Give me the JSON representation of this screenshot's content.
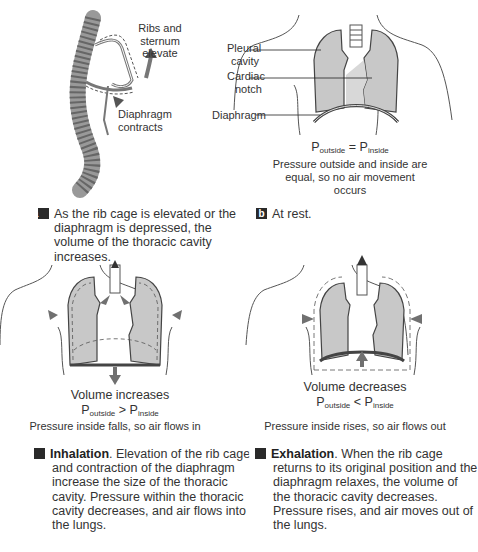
{
  "panels": {
    "a": {
      "badge": "a",
      "labels": {
        "ribs": [
          "Ribs and",
          "sternum",
          "elevate"
        ],
        "diaphragm": [
          "Diaphragm",
          "contracts"
        ]
      },
      "caption": "As the rib cage is elevated or the diaphragm is depressed, the volume of the thoracic cavity increases."
    },
    "b": {
      "badge": "b",
      "labels": {
        "pleural": [
          "Pleural",
          "cavity"
        ],
        "cardiac": [
          "Cardiac",
          "notch"
        ],
        "diaphragm": "Diaphragm"
      },
      "pressure": {
        "left": "P",
        "left_sub": "outside",
        "op": " = ",
        "right": "P",
        "right_sub": "inside"
      },
      "note": [
        "Pressure outside and inside are",
        "equal, so no air movement occurs"
      ],
      "caption": "At rest."
    },
    "c": {
      "badge": "c",
      "volume": "Volume increases",
      "pressure": {
        "left": "P",
        "left_sub": "outside",
        "op": " > ",
        "right": "P",
        "right_sub": "inside"
      },
      "note": "Pressure inside falls, so air flows in",
      "caption_title": "Inhalation",
      "caption": ". Elevation of the rib cage and contraction of the diaphragm increase the size of the thoracic cavity. Pressure within the thoracic cavity decreases, and air flows into the lungs."
    },
    "d": {
      "badge": "d",
      "volume": "Volume decreases",
      "pressure": {
        "left": "P",
        "left_sub": "outside",
        "op": " < ",
        "right": "P",
        "right_sub": "inside"
      },
      "note": "Pressure inside rises, so air flows out",
      "caption_title": "Exhalation",
      "caption": ". When the rib cage returns to its original position and the diaphragm relaxes, the volume of the thoracic cavity decreases. Pressure rises, and air moves out of the lungs."
    }
  },
  "colors": {
    "lung": "#c8c8c8",
    "arrow": "#707070",
    "badge": "#2a2a2a",
    "line": "#444444"
  }
}
